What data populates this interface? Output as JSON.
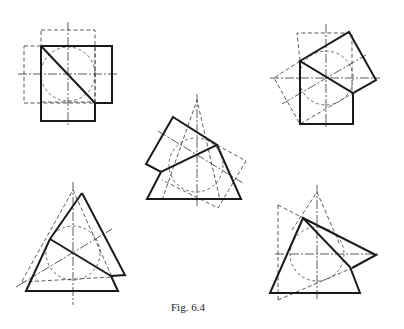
{
  "caption": "Fig. 6.4",
  "colors": {
    "background": "#ffffff",
    "line": "#1a1a1a"
  },
  "figures": [
    {
      "id": 1,
      "description": "Square rotated/overlapping square with inscribed dashed circle, diagonal cut"
    },
    {
      "id": 2,
      "description": "Square with rotated square hinged at upper-left corner, dashed construction square"
    },
    {
      "id": 3,
      "description": "Triangle with rotated square overlap, dashed construction triangle and square"
    },
    {
      "id": 4,
      "description": "Triangle with rotated triangle overlap, dashed construction triangle"
    },
    {
      "id": 5,
      "description": "Triangle with rotated triangle pivoting to right, dashed construction lines"
    }
  ]
}
